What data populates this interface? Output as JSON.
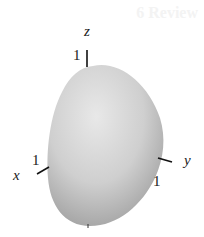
{
  "figure": {
    "ghost_heading": "6 Review",
    "axes": {
      "z": {
        "label": "z",
        "tick_label": "1"
      },
      "x": {
        "label": "x",
        "tick_label": "1"
      },
      "y": {
        "label": "y",
        "tick_label": "1"
      }
    },
    "surface": {
      "fill_light": "#e6e6e6",
      "fill_mid": "#c9c9c9",
      "fill_dark": "#a5a5a5"
    }
  }
}
